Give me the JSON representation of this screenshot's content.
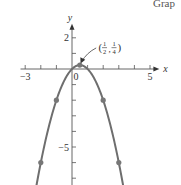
{
  "caption": "Grap",
  "chart_data": {
    "type": "line",
    "title": "",
    "function": "y = x - x^2",
    "xlabel": "x",
    "ylabel": "y",
    "xlim": [
      -3.3,
      5.6
    ],
    "ylim": [
      -7.7,
      2.9
    ],
    "x_tick_labels": [
      {
        "value": -3,
        "label": "−3"
      },
      {
        "value": 0,
        "label": "0"
      },
      {
        "value": 5,
        "label": "5"
      }
    ],
    "y_tick_labels": [
      {
        "value": 2,
        "label": "2"
      },
      {
        "value": -5,
        "label": "−5"
      }
    ],
    "x_ticks": [
      -3,
      -2,
      -1,
      1,
      2,
      3,
      4,
      5
    ],
    "y_ticks": [
      2,
      1,
      -1,
      -2,
      -3,
      -4,
      -5,
      -6,
      -7
    ],
    "grid": false,
    "series": [
      {
        "name": "y = x - x^2",
        "color": "#6e6e6e",
        "points": [
          {
            "x": -2,
            "y": -6
          },
          {
            "x": -1,
            "y": -2
          },
          {
            "x": 0,
            "y": 0
          },
          {
            "x": 0.5,
            "y": 0.25
          },
          {
            "x": 1,
            "y": 0
          },
          {
            "x": 2,
            "y": -2
          },
          {
            "x": 3,
            "y": -6
          }
        ],
        "marked_points": [
          {
            "x": -2,
            "y": -6
          },
          {
            "x": -1,
            "y": -2
          },
          {
            "x": 0.5,
            "y": 0.25
          },
          {
            "x": 2,
            "y": -2
          },
          {
            "x": 3,
            "y": -6
          }
        ]
      }
    ],
    "annotations": [
      {
        "text": "(1/2, 1/4)",
        "x": 0.5,
        "y": 0.25,
        "num1": "1",
        "den1": "2",
        "num2": "1",
        "den2": "4"
      }
    ]
  }
}
